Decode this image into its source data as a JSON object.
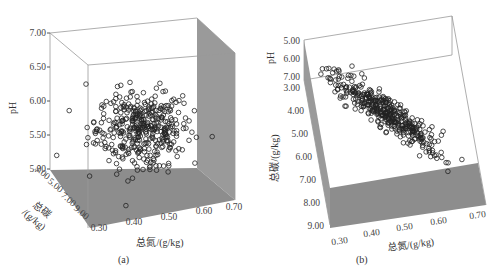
{
  "chart_data": [
    {
      "type": "scatter",
      "subtype": "3d-scatter",
      "panel": "(a)",
      "xlabel": "总氮/(g/kg)",
      "ylabel": "pH",
      "zlabel": "总碳/(g/kg)",
      "x_ticks": [
        "0.30",
        "0.40",
        "0.50",
        "0.60",
        "0.70"
      ],
      "y_ticks": [
        "5.00",
        "5.50",
        "6.00",
        "6.50",
        "7.00"
      ],
      "z_ticks": [
        "3.00",
        "5.00",
        "7.00",
        "9.00"
      ],
      "xlim": [
        0.27,
        0.72
      ],
      "ylim": [
        4.9,
        7.05
      ],
      "zlim": [
        3.0,
        9.0
      ],
      "description": "Roughly isotropic cloud of ~400 points centered near TN 0.43, pH 5.6; no clear trend between pH and TN.",
      "cluster_center": {
        "x": 0.43,
        "y": 5.6
      },
      "spread": {
        "x": 0.07,
        "y": 0.28
      },
      "n_points_approx": 400
    },
    {
      "type": "scatter",
      "subtype": "3d-scatter",
      "panel": "(b)",
      "xlabel": "总氮/(g/kg)",
      "ylabel": "总碳/(g/kg)",
      "zlabel": "pH",
      "x_ticks": [
        "0.30",
        "0.40",
        "0.50",
        "0.60",
        "0.70"
      ],
      "y_ticks": [
        "3.00",
        "4.00",
        "5.00",
        "6.00",
        "7.00",
        "8.00",
        "9.00"
      ],
      "z_ticks": [
        "5.00",
        "6.00",
        "7.00"
      ],
      "xlim": [
        0.27,
        0.72
      ],
      "ylim": [
        3.0,
        9.0
      ],
      "zlim": [
        5.0,
        7.0
      ],
      "description": "Strong positive linear relation between total N and total C; points along a diagonal band from (0.30, ~3.0) to (0.65, ~6.3).",
      "trend": {
        "x_start": 0.29,
        "y_start": 2.9,
        "x_end": 0.63,
        "y_end": 6.0
      },
      "n_points_approx": 400
    }
  ],
  "panels": {
    "a": {
      "caption": "(a)",
      "y_axis_title": "pH",
      "z_axis_title_line1": "总碳",
      "z_axis_title_line2": "/(g/kg)",
      "x_axis_title": "总氮/(g/kg)",
      "y_ticks": [
        "7.00",
        "6.50",
        "6.00",
        "5.50",
        "5.00"
      ],
      "z_ticks": [
        "3.00",
        "5.00",
        "7.00",
        "9.00"
      ],
      "x_ticks": [
        "0.30",
        "0.40",
        "0.50",
        "0.60",
        "0.70"
      ]
    },
    "b": {
      "caption": "(b)",
      "ph_axis_title": "pH",
      "c_axis_title": "总碳/(g/kg)",
      "x_axis_title": "总氮/(g/kg)",
      "ph_ticks": [
        "5.00",
        "6.00",
        "7.00"
      ],
      "c_ticks": [
        "3.00",
        "4.00",
        "5.00",
        "6.00",
        "7.00",
        "8.00",
        "9.00"
      ],
      "x_ticks": [
        "0.30",
        "0.40",
        "0.50",
        "0.60",
        "0.70"
      ]
    }
  },
  "colors": {
    "floor": "#8c8c8c",
    "wall": "#9a9a9a",
    "edge": "#888888",
    "marker": "#222222"
  }
}
